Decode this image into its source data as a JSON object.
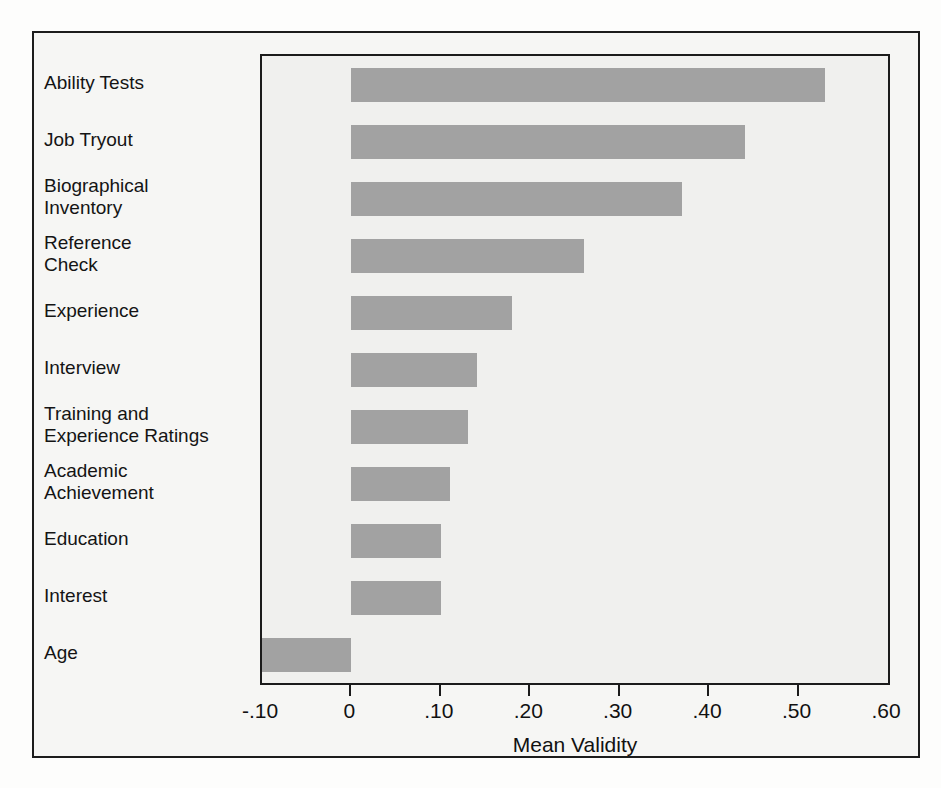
{
  "figure": {
    "axis_title": "Mean Validity",
    "bar_color": "#a2a2a2",
    "plot_background": "#f0f0ee",
    "frame_color": "#1c1c1c"
  },
  "chart_data": {
    "type": "bar",
    "orientation": "horizontal",
    "title": "",
    "xlabel": "Mean Validity",
    "ylabel": "",
    "xlim": [
      -0.1,
      0.6
    ],
    "grid": false,
    "legend": null,
    "categories": [
      "Ability Tests",
      "Job Tryout",
      "Biographical Inventory",
      "Reference Check",
      "Experience",
      "Interview",
      "Training and Experience Ratings",
      "Academic Achievement",
      "Education",
      "Interest",
      "Age"
    ],
    "values": [
      0.53,
      0.44,
      0.37,
      0.26,
      0.18,
      0.14,
      0.13,
      0.11,
      0.1,
      0.1,
      -0.01
    ],
    "tick_values": [
      -0.1,
      0,
      0.1,
      0.2,
      0.3,
      0.4,
      0.5,
      0.6
    ],
    "tick_labels": [
      "-.10",
      "0",
      ".10",
      ".20",
      ".30",
      ".40",
      ".50",
      ".60"
    ]
  },
  "labels": [
    {
      "lines": [
        "Ability Tests"
      ]
    },
    {
      "lines": [
        "Job Tryout"
      ]
    },
    {
      "lines": [
        "Biographical",
        "Inventory"
      ]
    },
    {
      "lines": [
        "Reference",
        "Check"
      ]
    },
    {
      "lines": [
        "Experience"
      ]
    },
    {
      "lines": [
        "Interview"
      ]
    },
    {
      "lines": [
        "Training and",
        "Experience Ratings"
      ]
    },
    {
      "lines": [
        "Academic",
        "Achievement"
      ]
    },
    {
      "lines": [
        "Education"
      ]
    },
    {
      "lines": [
        "Interest"
      ]
    },
    {
      "lines": [
        "Age"
      ]
    }
  ],
  "background_text": [
    "tests were used more frequently than",
    "other selection methods, more commonly",
    "the interview and reference checks were",
    "found",
    "Validity is the degree to which a",
    "selection device actually measures what",
    "it purports to measure. One cannot place",
    "great confidence in a selection technique",
    "unless there is evidence that the method",
    "predicts performance on the job",
    "to some reasonable degree.",
    "For selection to be effective, tests",
    "and other devices must demonstrate a",
    "relationship with performance on the job.",
    "Meta-analytic reviews have summarized",
    "the available evidence on validity."
  ]
}
